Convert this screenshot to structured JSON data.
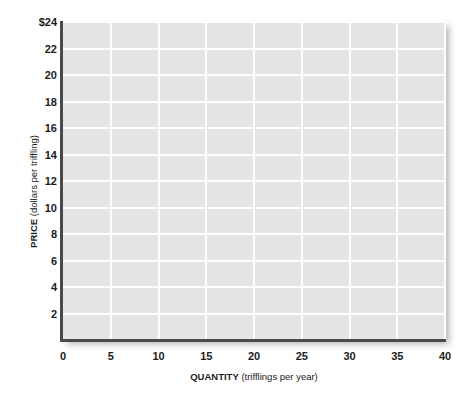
{
  "chart_data": {
    "type": "line",
    "title": "",
    "subtitle": "",
    "xlabel_strong": "QUANTITY",
    "xlabel_rest": " (trifflings per year)",
    "xlabel": "QUANTITY (trifflings per year)",
    "ylabel_strong": "PRICE",
    "ylabel_rest": " (dollars per triffling)",
    "ylabel": "PRICE (dollars per triffling)",
    "xlim": [
      0,
      40
    ],
    "ylim": [
      0,
      24
    ],
    "x_ticks": [
      0,
      5,
      10,
      15,
      20,
      25,
      30,
      35,
      40
    ],
    "x_tick_labels": [
      "0",
      "5",
      "10",
      "15",
      "20",
      "25",
      "30",
      "35",
      "40"
    ],
    "y_ticks": [
      2,
      4,
      6,
      8,
      10,
      12,
      14,
      16,
      18,
      20,
      22,
      24
    ],
    "y_tick_labels": [
      "2",
      "4",
      "6",
      "8",
      "10",
      "12",
      "14",
      "16",
      "18",
      "20",
      "22",
      "$24"
    ],
    "grid": true,
    "grid_color": "#fdfdfd",
    "plot_background": "#e4e4e4",
    "page_background": "#ffffff",
    "axis_color": "#4a4a4a",
    "legend": [],
    "series": [],
    "annotations": []
  }
}
